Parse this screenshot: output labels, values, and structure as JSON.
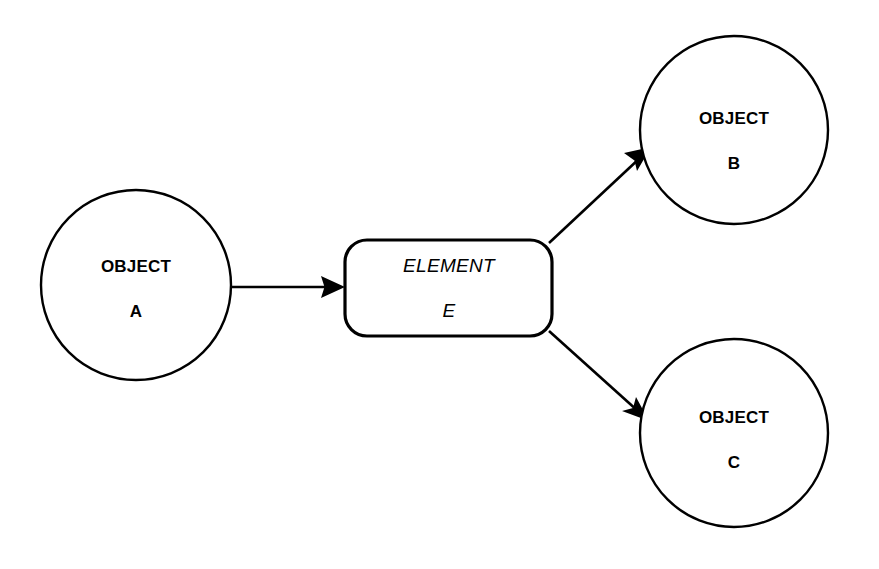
{
  "diagram": {
    "type": "flow-diagram",
    "background_color": "#ffffff",
    "stroke_color": "#000000",
    "nodes": [
      {
        "id": "object-a",
        "shape": "circle",
        "line1": "OBJECT",
        "line2": "A",
        "cx": 136,
        "cy": 285,
        "r": 95,
        "stroke_width": 2.4,
        "text_style": "bold"
      },
      {
        "id": "object-b",
        "shape": "circle",
        "line1": "OBJECT",
        "line2": "B",
        "cx": 734,
        "cy": 130,
        "r": 94,
        "stroke_width": 2.4,
        "text_style": "bold"
      },
      {
        "id": "object-c",
        "shape": "circle",
        "line1": "OBJECT",
        "line2": "C",
        "cx": 734,
        "cy": 433,
        "r": 94,
        "stroke_width": 2.4,
        "text_style": "bold"
      },
      {
        "id": "element-e",
        "shape": "rounded-rectangle",
        "line1": "ELEMENT",
        "line2": "E",
        "x": 345,
        "y": 240,
        "width": 207,
        "height": 96,
        "corner_radius": 22,
        "stroke_width": 3.2,
        "text_style": "italic"
      }
    ],
    "connectors": [
      {
        "id": "a-to-e",
        "from": "object-a",
        "to": "element-e",
        "orientation": "horizontal",
        "x1": 231,
        "y1": 287,
        "x2": 344,
        "y2": 287,
        "stroke_width": 2.6,
        "arrowhead": "filled-triangle"
      },
      {
        "id": "e-to-b",
        "from": "element-e",
        "to": "object-b",
        "orientation": "diagonal-up-right",
        "x1": 549,
        "y1": 243,
        "x2": 650,
        "y2": 148,
        "stroke_width": 2.6,
        "arrowhead": "filled-triangle"
      },
      {
        "id": "e-to-c",
        "from": "element-e",
        "to": "object-c",
        "orientation": "diagonal-down-right",
        "x1": 549,
        "y1": 331,
        "x2": 648,
        "y2": 421,
        "stroke_width": 2.6,
        "arrowhead": "filled-triangle"
      }
    ]
  }
}
